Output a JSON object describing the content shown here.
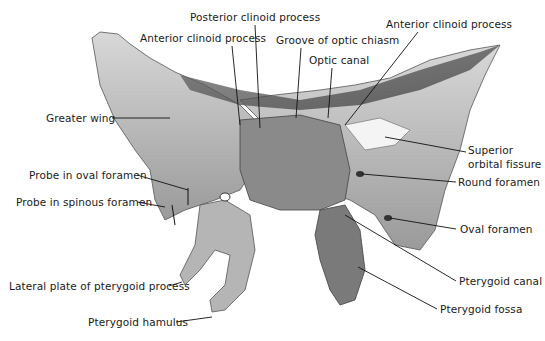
{
  "figure": {
    "labels": [
      {
        "id": "posterior-clinoid-process",
        "text": "Posterior clinoid process",
        "x": 190,
        "y": 11
      },
      {
        "id": "anterior-clinoid-process-left",
        "text": "Anterior clinoid process",
        "x": 140,
        "y": 32
      },
      {
        "id": "groove-of-optic-chiasm",
        "text": "Groove of optic chiasm",
        "x": 276,
        "y": 34
      },
      {
        "id": "anterior-clinoid-process-right",
        "text": "Anterior clinoid process",
        "x": 386,
        "y": 18
      },
      {
        "id": "optic-canal",
        "text": "Optic canal",
        "x": 309,
        "y": 54
      },
      {
        "id": "greater-wing",
        "text": "Greater wing",
        "x": 46,
        "y": 112
      },
      {
        "id": "superior-orbital-fissure-1",
        "text": "Superior",
        "x": 468,
        "y": 144
      },
      {
        "id": "superior-orbital-fissure-2",
        "text": "orbital fissure",
        "x": 468,
        "y": 158
      },
      {
        "id": "round-foramen",
        "text": "Round foramen",
        "x": 458,
        "y": 176
      },
      {
        "id": "probe-in-oval-foramen",
        "text": "Probe in oval foramen",
        "x": 29,
        "y": 169
      },
      {
        "id": "probe-in-spinous-foramen",
        "text": "Probe in spinous foramen",
        "x": 16,
        "y": 196
      },
      {
        "id": "oval-foramen",
        "text": "Oval foramen",
        "x": 460,
        "y": 223
      },
      {
        "id": "pterygoid-canal",
        "text": "Pterygoid canal",
        "x": 459,
        "y": 275
      },
      {
        "id": "lateral-plate-of-pterygoid-process",
        "text": "Lateral plate of pterygoid process",
        "x": 9,
        "y": 280
      },
      {
        "id": "pterygoid-fossa",
        "text": "Pterygoid fossa",
        "x": 440,
        "y": 303
      },
      {
        "id": "pterygoid-hamulus",
        "text": "Pterygoid hamulus",
        "x": 88,
        "y": 316
      }
    ]
  }
}
